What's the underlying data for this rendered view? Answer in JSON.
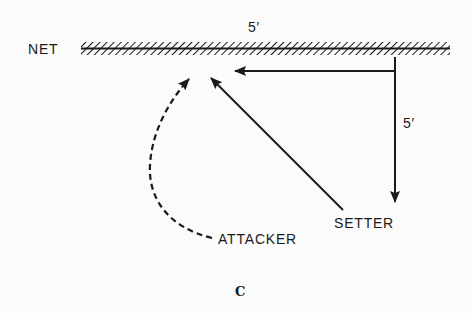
{
  "diagram": {
    "net_label": "NET",
    "top_distance_label": "5′",
    "side_distance_label": "5′",
    "setter_label": "SETTER",
    "attacker_label": "ATTACKER",
    "caption": "C",
    "colors": {
      "ink": "#1a1a1a",
      "background": "#fbfbfb"
    },
    "elements": [
      {
        "type": "net",
        "style": "hatched bar",
        "from": [
          81,
          49
        ],
        "to": [
          450,
          49
        ]
      },
      {
        "type": "arrow",
        "style": "solid",
        "description": "setter moves 5 ft along net toward attack zone",
        "from": [
          395,
          71
        ],
        "to": [
          233,
          71
        ]
      },
      {
        "type": "arrow",
        "style": "solid",
        "description": "setter drops back 5 ft from net",
        "from": [
          395,
          58
        ],
        "to": [
          395,
          203
        ]
      },
      {
        "type": "arrow",
        "style": "solid",
        "description": "set from setter to attack point",
        "from": [
          343,
          210
        ],
        "to": [
          210,
          77
        ]
      },
      {
        "type": "arrow",
        "style": "dashed curve",
        "description": "attacker approach path",
        "from": [
          210,
          238
        ],
        "to": [
          190,
          76
        ]
      }
    ]
  }
}
